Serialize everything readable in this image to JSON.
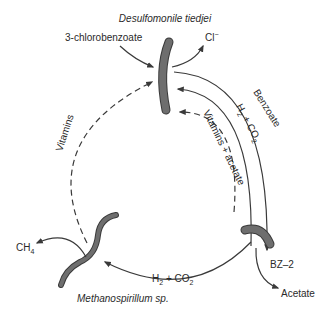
{
  "organisms": {
    "top": "Desulfomonile tiedjei",
    "bottom_left": "Methanospirillum sp.",
    "right": "BZ–2"
  },
  "inputs_outputs": {
    "chlorobenzoate": "3-chlorobenzoate",
    "chloride": "Cl",
    "chloride_charge": "−",
    "methane": "CH",
    "methane_sub": "4",
    "acetate": "Acetate"
  },
  "flows": {
    "benzoate": "Benzoate",
    "h2_co2_inner_h": "H",
    "h2_co2_inner_sub": "2",
    "h2_co2_inner_rest": " + CO",
    "h2_co2_inner_sub2": "2",
    "vitamins_acetate": "Vitamins + acetate",
    "vitamins": "Vitamins",
    "h2_co2_bottom_h": "H",
    "h2_co2_bottom_sub": "2",
    "h2_co2_bottom_rest": " + CO",
    "h2_co2_bottom_sub2": "2"
  },
  "colors": {
    "cell_fill": "#6e6e6e",
    "line": "#3a3a3a",
    "text": "#2a2a2a"
  }
}
